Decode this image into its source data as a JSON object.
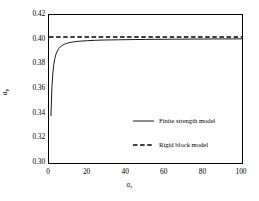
{
  "chart_data": {
    "type": "line",
    "title": "",
    "xlabel": "σc",
    "ylabel": "αp",
    "xlim": [
      0,
      100
    ],
    "ylim": [
      0.3,
      0.42
    ],
    "xticks": [
      0,
      20,
      40,
      60,
      80,
      100
    ],
    "yticks": [
      0.3,
      0.32,
      0.34,
      0.36,
      0.38,
      0.4,
      0.42
    ],
    "xtick_labels": [
      "0",
      "20",
      "40",
      "60",
      "80",
      "100"
    ],
    "ytick_labels": [
      "0.30",
      "0.32",
      "0.34",
      "0.36",
      "0.38",
      "0.40",
      "0.42"
    ],
    "grid": false,
    "legend_position": "center-right-inside",
    "series": [
      {
        "name": "Finite strength model",
        "style": "solid",
        "color": "#000000",
        "x": [
          1.0,
          1.5,
          2.0,
          2.5,
          3.0,
          3.5,
          4.0,
          5.0,
          6.0,
          7.0,
          8.0,
          9.0,
          10.0,
          12.0,
          14.0,
          16.0,
          18.0,
          20.0,
          24.0,
          28.0,
          32.0,
          36.0,
          40.0,
          45.0,
          50.0,
          55.0,
          60.0,
          65.0,
          70.0,
          75.0,
          80.0,
          85.0,
          90.0,
          95.0,
          100.0
        ],
        "y": [
          0.338,
          0.361,
          0.373,
          0.38,
          0.3845,
          0.3876,
          0.3898,
          0.3927,
          0.3944,
          0.3955,
          0.3963,
          0.3969,
          0.3974,
          0.398,
          0.3985,
          0.3988,
          0.399,
          0.3992,
          0.3995,
          0.3997,
          0.3998,
          0.3999,
          0.4,
          0.4001,
          0.4002,
          0.4003,
          0.4003,
          0.4004,
          0.4004,
          0.4005,
          0.4005,
          0.4006,
          0.4006,
          0.4006,
          0.4007
        ]
      },
      {
        "name": "Rigid block model",
        "style": "dashed",
        "color": "#000000",
        "constant_y": 0.4022,
        "x": [
          0,
          100
        ],
        "y": [
          0.4022,
          0.4022
        ]
      }
    ],
    "legend": [
      {
        "label": "Finite strength model",
        "style": "solid"
      },
      {
        "label": "Rigid block model",
        "style": "dashed"
      }
    ]
  },
  "axis": {
    "y_label_symbol": "α",
    "y_label_sub": "p",
    "x_label_symbol": "σ",
    "x_label_sub": "c"
  }
}
